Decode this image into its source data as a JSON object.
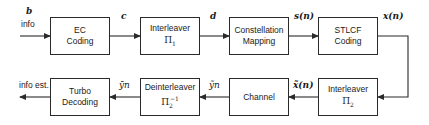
{
  "diagram": {
    "type": "block-diagram",
    "top_row": [
      {
        "id": "ec_coding",
        "line1": "EC",
        "line2": "Coding"
      },
      {
        "id": "interleaver1",
        "line1": "Interleaver",
        "math_base": "Π",
        "math_sub": "1",
        "math_sup": ""
      },
      {
        "id": "constellation",
        "line1": "Constellation",
        "line2": "Mapping"
      },
      {
        "id": "stlcf",
        "line1": "STLCF",
        "line2": "Coding"
      }
    ],
    "bottom_row": [
      {
        "id": "turbo",
        "line1": "Turbo",
        "line2": "Decoding"
      },
      {
        "id": "deinterleaver",
        "line1": "Deinterleaver",
        "math_base": "Π",
        "math_sub": "2",
        "math_sup": "−1"
      },
      {
        "id": "channel",
        "line1": "Channel"
      },
      {
        "id": "interleaver2",
        "line1": "Interleaver",
        "math_base": "Π",
        "math_sub": "2",
        "math_sup": ""
      }
    ],
    "signals": {
      "input_symbol": "b",
      "input_text": "info",
      "c": "c",
      "d": "d",
      "s": "s(n)",
      "x": "x(n)",
      "x_tilde": "x̃(n)",
      "y_tilde": "ỹn",
      "y": "ȳn",
      "output_text": "info est."
    },
    "colors": {
      "line": "#2a2a2a",
      "background": "#ffffff"
    }
  }
}
